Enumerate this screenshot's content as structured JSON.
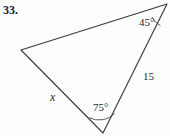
{
  "figure": {
    "problem_number": "33.",
    "shape": "triangle",
    "background_color": "#fdfdfd",
    "line_color": "#3b3b3b",
    "text_color": "#2b2b2b",
    "vertices": {
      "left": {
        "x": 21,
        "y": 50
      },
      "top_right": {
        "x": 167,
        "y": 4
      },
      "bottom": {
        "x": 103,
        "y": 133
      }
    },
    "labels": {
      "angle_top_right": "45°",
      "angle_bottom": "75°",
      "side_right": "15",
      "side_left": "x"
    },
    "paths": {
      "triangle": "M 21 50 L 167 4 L 103 133 Z",
      "arc_top_right": "M 152.1 17.3 A 18 18 0 0 0 160.1 25.5",
      "arc_bottom": "M 89.5 117.8 A 21 21 0 0 0 114.4 113.6"
    }
  }
}
